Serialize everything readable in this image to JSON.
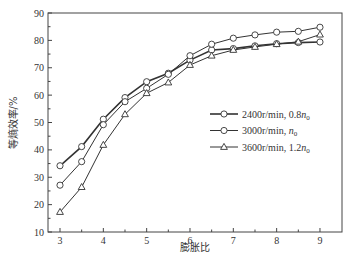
{
  "chart_data": {
    "type": "line",
    "title": "",
    "xlabel": "膨胀比",
    "ylabel": "等熵效率/%",
    "xlim": [
      2.7,
      9.5
    ],
    "ylim": [
      10,
      90
    ],
    "xticks": [
      3,
      4,
      5,
      6,
      7,
      8,
      9
    ],
    "yticks": [
      10,
      20,
      30,
      40,
      50,
      60,
      70,
      80,
      90
    ],
    "grid": false,
    "legend_position": "center-right",
    "x": [
      3,
      3.5,
      4,
      4.5,
      5,
      5.5,
      6,
      6.5,
      7,
      7.5,
      8,
      8.5,
      9
    ],
    "series": [
      {
        "name": "2400r/min, 0.8n0",
        "label_main": "2400r/min, 0.8",
        "label_sym": "n",
        "label_sub": "0",
        "marker": "circle",
        "line_width": 1.6,
        "values": [
          34.2,
          41.2,
          51.2,
          59.1,
          64.9,
          68.0,
          72.8,
          76.5,
          77.0,
          78.0,
          78.8,
          79.2,
          79.4
        ]
      },
      {
        "name": "3000r/min, n0",
        "label_main": "3000r/min, ",
        "label_sym": "n",
        "label_sub": "0",
        "marker": "circle",
        "line_width": 1.0,
        "values": [
          27.1,
          35.7,
          49.2,
          57.6,
          62.5,
          67.6,
          74.4,
          78.6,
          80.8,
          82.0,
          83.0,
          83.3,
          84.8
        ]
      },
      {
        "name": "3600r/min, 1.2n0",
        "label_main": "3600r/min, 1.2",
        "label_sym": "n",
        "label_sub": "0",
        "marker": "triangle",
        "line_width": 1.0,
        "values": [
          17.3,
          26.4,
          41.8,
          53.0,
          60.7,
          64.6,
          71.0,
          74.4,
          76.5,
          77.6,
          78.6,
          79.5,
          82.1
        ]
      }
    ]
  }
}
